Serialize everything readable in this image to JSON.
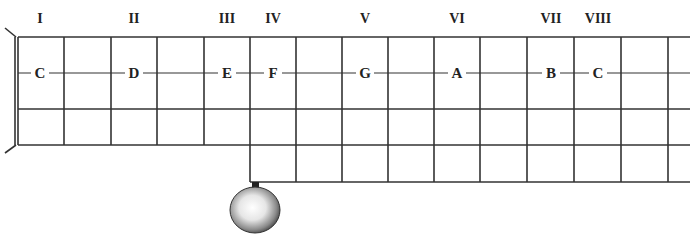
{
  "diagram": {
    "type": "fretboard",
    "positions": [
      {
        "label": "I",
        "x": 40
      },
      {
        "label": "II",
        "x": 134
      },
      {
        "label": "III",
        "x": 227
      },
      {
        "label": "IV",
        "x": 273
      },
      {
        "label": "V",
        "x": 365
      },
      {
        "label": "VI",
        "x": 457
      },
      {
        "label": "VII",
        "x": 551
      },
      {
        "label": "VIII",
        "x": 598
      }
    ],
    "notes": [
      {
        "label": "C",
        "x": 40
      },
      {
        "label": "D",
        "x": 134
      },
      {
        "label": "E",
        "x": 227
      },
      {
        "label": "F",
        "x": 273
      },
      {
        "label": "G",
        "x": 365
      },
      {
        "label": "A",
        "x": 457
      },
      {
        "label": "B",
        "x": 551
      },
      {
        "label": "C",
        "x": 598
      }
    ],
    "frets_x": [
      64,
      111,
      157,
      204,
      250,
      296,
      342,
      388,
      434,
      480,
      527,
      574,
      621,
      668
    ],
    "colors": {
      "line": "#333333",
      "text": "#222222"
    }
  }
}
